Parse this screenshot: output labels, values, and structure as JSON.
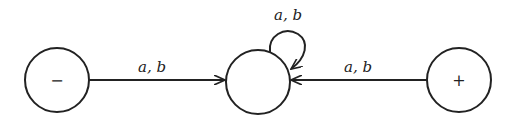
{
  "diagram": {
    "type": "finite-automaton",
    "states": [
      {
        "id": "start",
        "label": "−",
        "cx": 57,
        "cy": 80,
        "r": 32
      },
      {
        "id": "middle",
        "label": "",
        "cx": 258,
        "cy": 82,
        "r": 32
      },
      {
        "id": "final",
        "label": "+",
        "cx": 459,
        "cy": 80,
        "r": 32
      }
    ],
    "transitions": [
      {
        "from": "start",
        "to": "middle",
        "label": "a, b"
      },
      {
        "from": "middle",
        "to": "middle",
        "label": "a, b"
      },
      {
        "from": "final",
        "to": "middle",
        "label": "a, b"
      }
    ]
  }
}
